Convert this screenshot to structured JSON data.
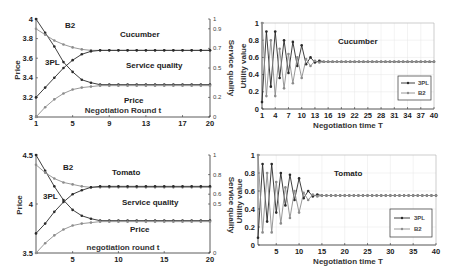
{
  "colors": {
    "series_3pl": "#2a2a2a",
    "series_b2": "#8c8c8c",
    "axis": "#333333",
    "grid": "#e6e6e6"
  },
  "chart_data": [
    {
      "id": "cucumber-price-quality",
      "type": "line",
      "title": "Cucumber",
      "xlabel": "Negotiation Round t",
      "ylabel": "Price",
      "ylabel_right": "Service quality",
      "x_ticks": [
        "1",
        "5",
        "9",
        "13",
        "17",
        "20"
      ],
      "y_ticks": [
        "3",
        "3.2",
        "3.4",
        "3.6",
        "3.8",
        "4"
      ],
      "y_right_ticks": [
        "0",
        "0.2",
        "0.5",
        "0.7",
        "0.9",
        "1"
      ],
      "xlim": [
        1,
        20
      ],
      "ylim": [
        3,
        4
      ],
      "ylim_right": [
        0,
        1
      ],
      "grid": false,
      "annotations": [
        "B2",
        "3PL",
        "Service quality",
        "Price"
      ],
      "x": [
        1,
        2,
        3,
        4,
        5,
        6,
        7,
        8,
        9,
        10,
        11,
        12,
        13,
        14,
        15,
        16,
        17,
        18,
        19,
        20
      ],
      "series": [
        {
          "name": "3PL price",
          "axis": "left",
          "values": [
            4.0,
            3.86,
            3.72,
            3.56,
            3.46,
            3.38,
            3.35,
            3.33,
            3.33,
            3.33,
            3.33,
            3.33,
            3.33,
            3.33,
            3.33,
            3.33,
            3.33,
            3.33,
            3.33,
            3.33
          ]
        },
        {
          "name": "B2 price",
          "axis": "left",
          "values": [
            3.9,
            3.84,
            3.78,
            3.74,
            3.71,
            3.69,
            3.68,
            3.68,
            3.68,
            3.68,
            3.68,
            3.68,
            3.68,
            3.68,
            3.68,
            3.68,
            3.68,
            3.68,
            3.68,
            3.68
          ]
        },
        {
          "name": "3PL service quality",
          "axis": "right",
          "values": [
            0.2,
            0.3,
            0.4,
            0.5,
            0.58,
            0.64,
            0.67,
            0.68,
            0.68,
            0.68,
            0.68,
            0.68,
            0.68,
            0.68,
            0.68,
            0.68,
            0.68,
            0.68,
            0.68,
            0.68
          ]
        },
        {
          "name": "B2 service quality",
          "axis": "right",
          "values": [
            0.0,
            0.1,
            0.18,
            0.24,
            0.28,
            0.3,
            0.31,
            0.32,
            0.32,
            0.32,
            0.32,
            0.32,
            0.32,
            0.32,
            0.32,
            0.32,
            0.32,
            0.32,
            0.32,
            0.32
          ]
        }
      ]
    },
    {
      "id": "cucumber-utility",
      "type": "line",
      "title": "Cucumber",
      "xlabel": "Negotiation time T",
      "ylabel": "Utility value",
      "x_ticks": [
        "1",
        "4",
        "7",
        "10",
        "13",
        "16",
        "19",
        "22",
        "25",
        "28",
        "31",
        "34",
        "37",
        "40"
      ],
      "y_ticks": [
        "0",
        "0.2",
        "0.4",
        "0.6",
        "0.8",
        "1"
      ],
      "xlim": [
        1,
        40
      ],
      "ylim": [
        0,
        1
      ],
      "grid": true,
      "legend": [
        "3PL",
        "B2"
      ],
      "legend_position": "lower right",
      "x": [
        1,
        2,
        3,
        4,
        5,
        6,
        7,
        8,
        9,
        10,
        11,
        12,
        13,
        14,
        15,
        16,
        17,
        18,
        19,
        20,
        21,
        22,
        23,
        24,
        25,
        26,
        27,
        28,
        29,
        30,
        31,
        32,
        33,
        34,
        35,
        36,
        37,
        38,
        39,
        40
      ],
      "series": [
        {
          "name": "3PL",
          "values": [
            0.08,
            0.9,
            0.26,
            0.9,
            0.36,
            0.8,
            0.42,
            0.78,
            0.5,
            0.74,
            0.52,
            0.6,
            0.54,
            0.56,
            0.55,
            0.55,
            0.55,
            0.55,
            0.55,
            0.55,
            0.55,
            0.55,
            0.55,
            0.55,
            0.55,
            0.55,
            0.55,
            0.55,
            0.55,
            0.55,
            0.55,
            0.55,
            0.55,
            0.55,
            0.55,
            0.55,
            0.55,
            0.55,
            0.55,
            0.55
          ]
        },
        {
          "name": "B2",
          "values": [
            1.0,
            0.15,
            0.8,
            0.15,
            0.7,
            0.24,
            0.64,
            0.3,
            0.6,
            0.36,
            0.58,
            0.5,
            0.56,
            0.54,
            0.55,
            0.55,
            0.55,
            0.55,
            0.55,
            0.55,
            0.55,
            0.55,
            0.55,
            0.55,
            0.55,
            0.55,
            0.55,
            0.55,
            0.55,
            0.55,
            0.55,
            0.55,
            0.55,
            0.55,
            0.55,
            0.55,
            0.55,
            0.55,
            0.55,
            0.55
          ]
        }
      ]
    },
    {
      "id": "tomato-price-quality",
      "type": "line",
      "title": "Tomato",
      "xlabel": "negotiation round t",
      "ylabel": "Price",
      "ylabel_right": "Service quality",
      "x_ticks": [
        "5",
        "10",
        "15",
        "20"
      ],
      "y_ticks": [
        "3.5",
        "4",
        "4.5"
      ],
      "y_right_ticks": [
        "0",
        "0.5",
        "0.6",
        "0.8",
        "1"
      ],
      "xlim": [
        1,
        20
      ],
      "ylim": [
        3.5,
        4.5
      ],
      "ylim_right": [
        0,
        1
      ],
      "grid": false,
      "annotations": [
        "B2",
        "3PL",
        "Service quality",
        "Price"
      ],
      "x": [
        1,
        2,
        3,
        4,
        5,
        6,
        7,
        8,
        9,
        10,
        11,
        12,
        13,
        14,
        15,
        16,
        17,
        18,
        19,
        20
      ],
      "series": [
        {
          "name": "3PL price",
          "axis": "left",
          "values": [
            4.5,
            4.34,
            4.18,
            4.04,
            3.94,
            3.88,
            3.85,
            3.83,
            3.83,
            3.83,
            3.83,
            3.83,
            3.83,
            3.83,
            3.83,
            3.83,
            3.83,
            3.83,
            3.83,
            3.83
          ]
        },
        {
          "name": "B2 price",
          "axis": "left",
          "values": [
            4.4,
            4.32,
            4.26,
            4.22,
            4.2,
            4.18,
            4.17,
            4.17,
            4.17,
            4.17,
            4.17,
            4.17,
            4.17,
            4.17,
            4.17,
            4.17,
            4.17,
            4.17,
            4.17,
            4.17
          ]
        },
        {
          "name": "3PL service quality",
          "axis": "right",
          "values": [
            0.2,
            0.3,
            0.42,
            0.52,
            0.6,
            0.64,
            0.67,
            0.68,
            0.68,
            0.68,
            0.68,
            0.68,
            0.68,
            0.68,
            0.68,
            0.68,
            0.68,
            0.68,
            0.68,
            0.68
          ]
        },
        {
          "name": "B2 service quality",
          "axis": "right",
          "values": [
            0.0,
            0.1,
            0.18,
            0.24,
            0.28,
            0.3,
            0.31,
            0.32,
            0.32,
            0.32,
            0.32,
            0.32,
            0.32,
            0.32,
            0.32,
            0.32,
            0.32,
            0.32,
            0.32,
            0.32
          ]
        }
      ]
    },
    {
      "id": "tomato-utility",
      "type": "line",
      "title": "Tomato",
      "xlabel": "Negotiation time T",
      "ylabel": "Utility value",
      "x_ticks": [
        "5",
        "10",
        "15",
        "20",
        "25",
        "30",
        "35",
        "40"
      ],
      "y_ticks": [
        "0",
        "0.2",
        "0.4",
        "0.6",
        "0.8",
        "1"
      ],
      "xlim": [
        1,
        40
      ],
      "ylim": [
        0,
        1
      ],
      "grid": true,
      "legend": [
        "3PL",
        "B2"
      ],
      "legend_position": "lower right",
      "x": [
        1,
        2,
        3,
        4,
        5,
        6,
        7,
        8,
        9,
        10,
        11,
        12,
        13,
        14,
        15,
        16,
        17,
        18,
        19,
        20,
        21,
        22,
        23,
        24,
        25,
        26,
        27,
        28,
        29,
        30,
        31,
        32,
        33,
        34,
        35,
        36,
        37,
        38,
        39,
        40
      ],
      "series": [
        {
          "name": "3PL",
          "values": [
            0.08,
            0.9,
            0.26,
            0.9,
            0.36,
            0.8,
            0.44,
            0.78,
            0.5,
            0.74,
            0.52,
            0.6,
            0.54,
            0.56,
            0.55,
            0.55,
            0.55,
            0.55,
            0.55,
            0.55,
            0.55,
            0.55,
            0.55,
            0.55,
            0.55,
            0.55,
            0.55,
            0.55,
            0.55,
            0.55,
            0.55,
            0.55,
            0.55,
            0.55,
            0.55,
            0.55,
            0.55,
            0.55,
            0.55,
            0.55
          ]
        },
        {
          "name": "B2",
          "values": [
            1.0,
            0.14,
            0.8,
            0.14,
            0.7,
            0.24,
            0.64,
            0.3,
            0.6,
            0.36,
            0.58,
            0.5,
            0.56,
            0.54,
            0.55,
            0.55,
            0.55,
            0.55,
            0.55,
            0.55,
            0.55,
            0.55,
            0.55,
            0.55,
            0.55,
            0.55,
            0.55,
            0.55,
            0.55,
            0.55,
            0.55,
            0.55,
            0.55,
            0.55,
            0.55,
            0.55,
            0.55,
            0.55,
            0.55,
            0.55
          ]
        }
      ]
    }
  ]
}
